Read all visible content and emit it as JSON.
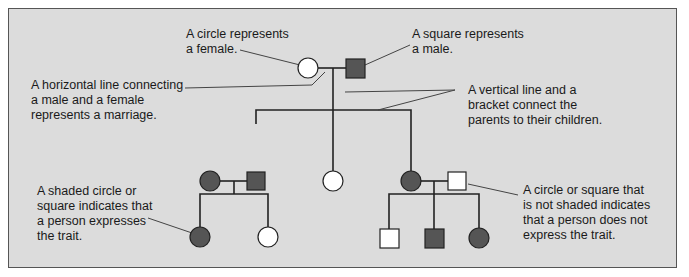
{
  "diagram": {
    "colors": {
      "background": "#dcdcdc",
      "frame_border": "#555555",
      "shaded": "#555555",
      "unshaded": "#ffffff",
      "line": "#222222",
      "callout_line": "#444444"
    },
    "labels": {
      "circle_female": "A circle represents\na female.",
      "square_male": "A square represents\na male.",
      "horizontal_line": "A horizontal line connecting\na male and a female\nrepresents a marriage.",
      "vertical_line": "A vertical line and a\nbracket connect the\nparents to their children.",
      "shaded": "A shaded circle or\nsquare indicates that\na person expresses\nthe trait.",
      "not_shaded": "A circle or square that\nis not shaded indicates\nthat a person does not\nexpress the trait."
    },
    "generations": [
      {
        "id": "I",
        "individuals": [
          {
            "sex": "female",
            "shaded": false
          },
          {
            "sex": "male",
            "shaded": true
          }
        ]
      },
      {
        "id": "II",
        "individuals": [
          {
            "sex": "female",
            "shaded": true,
            "note": "married in"
          },
          {
            "sex": "male",
            "shaded": true
          },
          {
            "sex": "female",
            "shaded": false
          },
          {
            "sex": "female",
            "shaded": true
          },
          {
            "sex": "male",
            "shaded": false,
            "note": "married in"
          }
        ]
      },
      {
        "id": "III",
        "individuals": [
          {
            "sex": "female",
            "shaded": true
          },
          {
            "sex": "female",
            "shaded": false
          },
          {
            "sex": "male",
            "shaded": false
          },
          {
            "sex": "male",
            "shaded": true
          },
          {
            "sex": "female",
            "shaded": true
          }
        ]
      }
    ]
  }
}
